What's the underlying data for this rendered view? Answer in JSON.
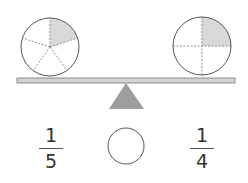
{
  "diagram": {
    "type": "balance-scale-fraction-comparison",
    "left_pan": {
      "shape": "circle",
      "parts": 5,
      "shaded": 1,
      "fraction": {
        "numerator": "1",
        "denominator": "5"
      }
    },
    "right_pan": {
      "shape": "circle",
      "parts": 4,
      "shaded": 1,
      "fraction": {
        "numerator": "1",
        "denominator": "4"
      }
    },
    "comparison_blank": "",
    "colors": {
      "shade": "#d9d9d9",
      "outline": "#555555",
      "beam_fill": "#d4d4d4",
      "fulcrum": "#9e9e9e"
    }
  }
}
